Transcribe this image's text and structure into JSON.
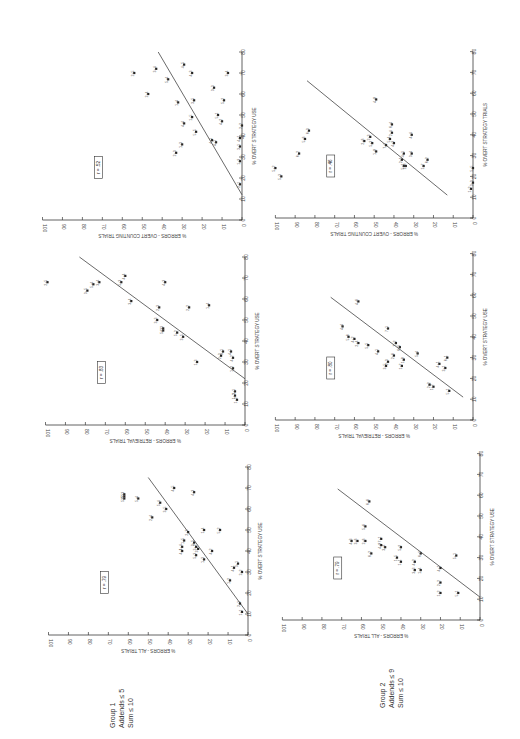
{
  "figure": {
    "orientation": "rotated-90-ccw",
    "groups": [
      {
        "id": "group1",
        "label_lines": [
          "Group 1",
          "Addends ≤ 5",
          "Sum ≤ 10"
        ]
      },
      {
        "id": "group2",
        "label_lines": [
          "Group 2",
          "Addends ≤ 9",
          "Sum ≤ 10"
        ]
      }
    ]
  },
  "chart_data": [
    {
      "id": "g1-all",
      "type": "scatter",
      "group": "Group 1",
      "title": "",
      "xlabel": "% OVERT STRATEGY USE",
      "ylabel": "% ERRORS - ALL TRIALS",
      "xlim": [
        0,
        80
      ],
      "ylim": [
        0,
        100
      ],
      "xticks": [
        0,
        10,
        20,
        30,
        40,
        50,
        60,
        70,
        80
      ],
      "yticks": [
        0,
        10,
        20,
        30,
        40,
        50,
        60,
        70,
        80,
        90,
        100
      ],
      "r_label": "r = .79",
      "fit_line": [
        [
          10,
          0
        ],
        [
          75,
          50
        ]
      ],
      "points": [
        {
          "label": "1+1",
          "x": 11,
          "y": 3
        },
        {
          "label": "2+1",
          "x": 15,
          "y": 4
        },
        {
          "label": "1+2",
          "x": 26,
          "y": 9
        },
        {
          "label": "2+2",
          "x": 30,
          "y": 3
        },
        {
          "label": "3+1",
          "x": 34,
          "y": 5
        },
        {
          "label": "4+1",
          "x": 32,
          "y": 7
        },
        {
          "label": "1+3",
          "x": 36,
          "y": 22
        },
        {
          "label": "4+2",
          "x": 40,
          "y": 18
        },
        {
          "label": "3+3",
          "x": 41,
          "y": 25
        },
        {
          "label": "5+3",
          "x": 38,
          "y": 26
        },
        {
          "label": "3+2",
          "x": 42,
          "y": 26
        },
        {
          "label": "1+5",
          "x": 45,
          "y": 32
        },
        {
          "label": "1+4",
          "x": 42,
          "y": 33
        },
        {
          "label": "4+4",
          "x": 40,
          "y": 33
        },
        {
          "label": "2+3",
          "x": 49,
          "y": 30
        },
        {
          "label": "3+5",
          "x": 44,
          "y": 27
        },
        {
          "label": "1+4b",
          "x": 50,
          "y": 22
        },
        {
          "label": "5+2",
          "x": 50,
          "y": 14
        },
        {
          "label": "2+4",
          "x": 56,
          "y": 48
        },
        {
          "label": "3+5b",
          "x": 60,
          "y": 41
        },
        {
          "label": "5+4",
          "x": 63,
          "y": 44
        },
        {
          "label": "4+3",
          "x": 68,
          "y": 27
        },
        {
          "label": "4+5",
          "x": 70,
          "y": 37
        },
        {
          "label": "5+5",
          "x": 65,
          "y": 62
        },
        {
          "label": "2+5",
          "x": 66,
          "y": 62
        },
        {
          "label": "5+3b",
          "x": 67,
          "y": 62
        },
        {
          "label": "5+4b",
          "x": 65,
          "y": 55
        }
      ]
    },
    {
      "id": "g1-retrieval",
      "type": "scatter",
      "group": "Group 1",
      "title": "",
      "xlabel": "% OVERT STRATEGY USE",
      "ylabel": "% ERRORS - RETRIEVAL TRIALS",
      "xlim": [
        0,
        80
      ],
      "ylim": [
        0,
        100
      ],
      "xticks": [
        0,
        10,
        20,
        30,
        40,
        50,
        60,
        70,
        80
      ],
      "yticks": [
        0,
        10,
        20,
        30,
        40,
        50,
        60,
        70,
        80,
        90,
        100
      ],
      "r_label": "r = .83",
      "fit_line": [
        [
          22,
          0
        ],
        [
          80,
          83
        ]
      ],
      "points": [
        {
          "label": "1+2",
          "x": 12,
          "y": 4
        },
        {
          "label": "1+1",
          "x": 14,
          "y": 5
        },
        {
          "label": "2+1",
          "x": 16,
          "y": 5
        },
        {
          "label": "1+3",
          "x": 30,
          "y": 24
        },
        {
          "label": "1+2b",
          "x": 27,
          "y": 6
        },
        {
          "label": "4+2",
          "x": 32,
          "y": 6
        },
        {
          "label": "2+2",
          "x": 33,
          "y": 12
        },
        {
          "label": "3+1",
          "x": 35,
          "y": 11
        },
        {
          "label": "4+1",
          "x": 35,
          "y": 7
        },
        {
          "label": "3+5",
          "x": 42,
          "y": 31
        },
        {
          "label": "5+2",
          "x": 44,
          "y": 34
        },
        {
          "label": "5+3",
          "x": 45,
          "y": 41
        },
        {
          "label": "4+3",
          "x": 46,
          "y": 41
        },
        {
          "label": "3+3",
          "x": 50,
          "y": 44
        },
        {
          "label": "2+2b",
          "x": 56,
          "y": 28
        },
        {
          "label": "1+4",
          "x": 57,
          "y": 18
        },
        {
          "label": "2+3",
          "x": 56,
          "y": 43
        },
        {
          "label": "3+4",
          "x": 59,
          "y": 57
        },
        {
          "label": "5+3c",
          "x": 68,
          "y": 62
        },
        {
          "label": "4+3b",
          "x": 68,
          "y": 40
        },
        {
          "label": "4+4",
          "x": 71,
          "y": 60
        },
        {
          "label": "3+5b",
          "x": 64,
          "y": 79
        },
        {
          "label": "5+4",
          "x": 67,
          "y": 76
        },
        {
          "label": "3+4b",
          "x": 68,
          "y": 73
        },
        {
          "label": "2+5",
          "x": 68,
          "y": 99
        }
      ]
    },
    {
      "id": "g1-counting",
      "type": "scatter",
      "group": "Group 1",
      "title": "",
      "xlabel": "% OVERT STRATEGY USE",
      "ylabel": "% ERRORS - OVERT COUNTING TRIALS",
      "xlim": [
        0,
        80
      ],
      "ylim": [
        0,
        100
      ],
      "xticks": [
        0,
        10,
        20,
        30,
        40,
        50,
        60,
        70,
        80
      ],
      "yticks": [
        0,
        10,
        20,
        30,
        40,
        50,
        60,
        70,
        80,
        90,
        100
      ],
      "r_label": "r = .52",
      "fit_line": [
        [
          12,
          0
        ],
        [
          80,
          42
        ]
      ],
      "points": [
        {
          "label": "2+1",
          "x": 17,
          "y": 1
        },
        {
          "label": "1+3",
          "x": 28,
          "y": 1
        },
        {
          "label": "3+1",
          "x": 35,
          "y": 1
        },
        {
          "label": "4+1",
          "x": 39,
          "y": 1
        },
        {
          "label": "2+2",
          "x": 45,
          "y": 0
        },
        {
          "label": "4+1b",
          "x": 37,
          "y": 13
        },
        {
          "label": "4+1c",
          "x": 38,
          "y": 15
        },
        {
          "label": "5+1",
          "x": 50,
          "y": 12
        },
        {
          "label": "4+2",
          "x": 47,
          "y": 10
        },
        {
          "label": "3+3",
          "x": 63,
          "y": 14
        },
        {
          "label": "5+2",
          "x": 57,
          "y": 9
        },
        {
          "label": "3+5",
          "x": 57,
          "y": 24
        },
        {
          "label": "4+3",
          "x": 70,
          "y": 25
        },
        {
          "label": "4+5",
          "x": 74,
          "y": 29
        },
        {
          "label": "3+4",
          "x": 70,
          "y": 7
        },
        {
          "label": "1+5",
          "x": 49,
          "y": 25
        },
        {
          "label": "5+5",
          "x": 42,
          "y": 23
        },
        {
          "label": "4+4",
          "x": 46,
          "y": 29
        },
        {
          "label": "1+3b",
          "x": 36,
          "y": 30
        },
        {
          "label": "2+3",
          "x": 32,
          "y": 33
        },
        {
          "label": "1+4",
          "x": 56,
          "y": 32
        },
        {
          "label": "5+4",
          "x": 67,
          "y": 37
        },
        {
          "label": "3+4b",
          "x": 72,
          "y": 43
        },
        {
          "label": "2+4",
          "x": 60,
          "y": 47
        },
        {
          "label": "2+5",
          "x": 70,
          "y": 54
        }
      ]
    },
    {
      "id": "g2-all",
      "type": "scatter",
      "group": "Group 2",
      "title": "",
      "xlabel": "% OVERT STRATEGY USE",
      "ylabel": "% ERRORS - ALL TRIALS",
      "xlim": [
        0,
        80
      ],
      "ylim": [
        0,
        100
      ],
      "xticks": [
        0,
        10,
        20,
        30,
        40,
        50,
        60,
        70,
        80
      ],
      "yticks": [
        0,
        10,
        20,
        30,
        40,
        50,
        60,
        70,
        80,
        90,
        100
      ],
      "r_label": "r = .79",
      "fit_line": [
        [
          11,
          0
        ],
        [
          63,
          72
        ]
      ],
      "points": [
        {
          "label": "5+1",
          "x": 13,
          "y": 11
        },
        {
          "label": "1+2",
          "x": 13,
          "y": 20
        },
        {
          "label": "2+2",
          "x": 18,
          "y": 20
        },
        {
          "label": "4+1",
          "x": 25,
          "y": 20
        },
        {
          "label": "5+1b",
          "x": 31,
          "y": 12
        },
        {
          "label": "1+4",
          "x": 24,
          "y": 30
        },
        {
          "label": "3+3",
          "x": 24,
          "y": 33
        },
        {
          "label": "4+2",
          "x": 28,
          "y": 33
        },
        {
          "label": "1+1",
          "x": 28,
          "y": 40
        },
        {
          "label": "1+5",
          "x": 30,
          "y": 42
        },
        {
          "label": "6+1",
          "x": 32,
          "y": 30
        },
        {
          "label": "5+2",
          "x": 35,
          "y": 40
        },
        {
          "label": "3+4",
          "x": 35,
          "y": 48
        },
        {
          "label": "4+8",
          "x": 36,
          "y": 50
        },
        {
          "label": "6+2",
          "x": 32,
          "y": 55
        },
        {
          "label": "7+1",
          "x": 39,
          "y": 50
        },
        {
          "label": "2+6",
          "x": 38,
          "y": 58
        },
        {
          "label": "3+6",
          "x": 38,
          "y": 62
        },
        {
          "label": "4+3",
          "x": 38,
          "y": 65
        },
        {
          "label": "5+6",
          "x": 45,
          "y": 58
        },
        {
          "label": "6+6",
          "x": 57,
          "y": 56
        }
      ]
    },
    {
      "id": "g2-retrieval",
      "type": "scatter",
      "group": "Group 2",
      "title": "",
      "xlabel": "% OVERT STRATEGY USE",
      "ylabel": "% ERRORS - RETRIEVAL TRIALS",
      "xlim": [
        0,
        80
      ],
      "ylim": [
        0,
        100
      ],
      "xticks": [
        0,
        10,
        20,
        30,
        40,
        50,
        60,
        70,
        80
      ],
      "yticks": [
        0,
        10,
        20,
        30,
        40,
        50,
        60,
        70,
        80,
        90,
        100
      ],
      "r_label": "r = .80",
      "fit_line": [
        [
          11,
          5
        ],
        [
          59,
          72
        ]
      ],
      "points": [
        {
          "label": "5+1",
          "x": 14,
          "y": 12
        },
        {
          "label": "1+2",
          "x": 16,
          "y": 20
        },
        {
          "label": "2+2",
          "x": 17,
          "y": 22
        },
        {
          "label": "3+1",
          "x": 25,
          "y": 14
        },
        {
          "label": "4+1",
          "x": 27,
          "y": 17
        },
        {
          "label": "6+1",
          "x": 30,
          "y": 13
        },
        {
          "label": "1+7",
          "x": 26,
          "y": 36
        },
        {
          "label": "3+5",
          "x": 26,
          "y": 44
        },
        {
          "label": "2+3",
          "x": 28,
          "y": 43
        },
        {
          "label": "1+8",
          "x": 29,
          "y": 35
        },
        {
          "label": "2+6",
          "x": 31,
          "y": 40
        },
        {
          "label": "5+4",
          "x": 32,
          "y": 28
        },
        {
          "label": "4+1b",
          "x": 33,
          "y": 48
        },
        {
          "label": "6+5",
          "x": 35,
          "y": 37
        },
        {
          "label": "7+2",
          "x": 37,
          "y": 39
        },
        {
          "label": "7+1",
          "x": 44,
          "y": 43
        },
        {
          "label": "5+5",
          "x": 36,
          "y": 53
        },
        {
          "label": "2+4",
          "x": 37,
          "y": 58
        },
        {
          "label": "4+2",
          "x": 39,
          "y": 60
        },
        {
          "label": "5+6",
          "x": 40,
          "y": 63
        },
        {
          "label": "4+4",
          "x": 45,
          "y": 66
        },
        {
          "label": "4+6",
          "x": 57,
          "y": 58
        }
      ]
    },
    {
      "id": "g2-counting",
      "type": "scatter",
      "group": "Group 2",
      "title": "",
      "xlabel": "% OVERT STRATEGY TRIALS",
      "ylabel": "% ERRORS - OVERT COUNTING TRIALS",
      "xlim": [
        0,
        80
      ],
      "ylim": [
        0,
        100
      ],
      "xticks": [
        0,
        10,
        20,
        30,
        40,
        50,
        60,
        70,
        80
      ],
      "yticks": [
        0,
        10,
        20,
        30,
        40,
        50,
        60,
        70,
        80,
        90,
        100
      ],
      "r_label": "r = .46",
      "fit_line": [
        [
          11,
          13
        ],
        [
          66,
          84
        ]
      ],
      "points": [
        {
          "label": "1+2",
          "x": 14,
          "y": 1
        },
        {
          "label": "3+3",
          "x": 17,
          "y": 0
        },
        {
          "label": "5+5",
          "x": 24,
          "y": 0
        },
        {
          "label": "5+1",
          "x": 25,
          "y": 35
        },
        {
          "label": "1+7",
          "x": 25,
          "y": 25
        },
        {
          "label": "6+2",
          "x": 28,
          "y": 23
        },
        {
          "label": "1+6",
          "x": 25,
          "y": 34
        },
        {
          "label": "2+1",
          "x": 28,
          "y": 36
        },
        {
          "label": "3+4",
          "x": 31,
          "y": 31
        },
        {
          "label": "4+1",
          "x": 31,
          "y": 35
        },
        {
          "label": "7+1",
          "x": 35,
          "y": 44
        },
        {
          "label": "4+3",
          "x": 36,
          "y": 40
        },
        {
          "label": "5+4",
          "x": 38,
          "y": 42
        },
        {
          "label": "2+4",
          "x": 41,
          "y": 41
        },
        {
          "label": "1+8",
          "x": 32,
          "y": 49
        },
        {
          "label": "5+3",
          "x": 36,
          "y": 51
        },
        {
          "label": "2+6",
          "x": 37,
          "y": 55
        },
        {
          "label": "2+3",
          "x": 39,
          "y": 52
        },
        {
          "label": "4+4",
          "x": 40,
          "y": 31
        },
        {
          "label": "6+4",
          "x": 45,
          "y": 41
        },
        {
          "label": "4+8",
          "x": 57,
          "y": 49
        },
        {
          "label": "5+6",
          "x": 38,
          "y": 85
        },
        {
          "label": "6+3",
          "x": 42,
          "y": 83
        },
        {
          "label": "6+2b",
          "x": 31,
          "y": 88
        },
        {
          "label": "5+2",
          "x": 24,
          "y": 100
        },
        {
          "label": "5+3b",
          "x": 20,
          "y": 97
        }
      ]
    }
  ]
}
